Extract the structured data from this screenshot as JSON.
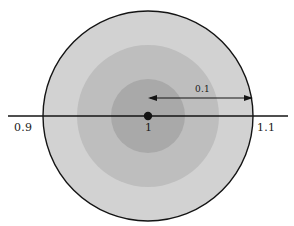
{
  "figure": {
    "background_color": "#ffffff",
    "width": 294,
    "height": 226
  },
  "axis": {
    "name": "number-line",
    "color": "#141414",
    "stroke_width": 1.6,
    "y": 116,
    "x_start": 8,
    "x_end": 288,
    "ticks": [
      {
        "label": "0.9",
        "x": 43
      },
      {
        "label": "1",
        "x": 148
      },
      {
        "label": "1.1",
        "x": 253
      }
    ]
  },
  "center_point": {
    "label": "1",
    "x": 148,
    "y": 116,
    "radius": 4.2,
    "color": "#141414"
  },
  "annotation": {
    "label": "0.1",
    "arrow_y": 98,
    "arrow_x_start": 148,
    "arrow_x_end": 253,
    "color": "#141414"
  },
  "chart_data": {
    "type": "scatter",
    "title": "",
    "subtitle": "",
    "xlabel": "",
    "ylabel": "",
    "grid": false,
    "legend": null,
    "center_value": 1,
    "radius_value": 0.1,
    "xlim": [
      0.87,
      1.13
    ],
    "tick_labels": [
      "0.9",
      "1",
      "1.1"
    ],
    "tick_values": [
      0.9,
      1,
      1.1
    ],
    "annotations": [
      {
        "text": "0.1",
        "from": 1,
        "to": 1.1,
        "kind": "double-arrow"
      }
    ],
    "circles": [
      {
        "name": "outer-disk",
        "center": 1,
        "radius_value": 0.1,
        "radius_px": 105,
        "fill": "#d2d2d2",
        "stroke": "#141414",
        "stroke_width": 1.4
      },
      {
        "name": "middle-disk",
        "center": 1,
        "radius_value": 0.0676,
        "radius_px": 71,
        "fill": "#bebebe",
        "stroke": "none",
        "stroke_width": 0
      },
      {
        "name": "inner-disk",
        "center": 1,
        "radius_value": 0.0352,
        "radius_px": 37,
        "fill": "#a9a9a9",
        "stroke": "none",
        "stroke_width": 0
      }
    ]
  }
}
